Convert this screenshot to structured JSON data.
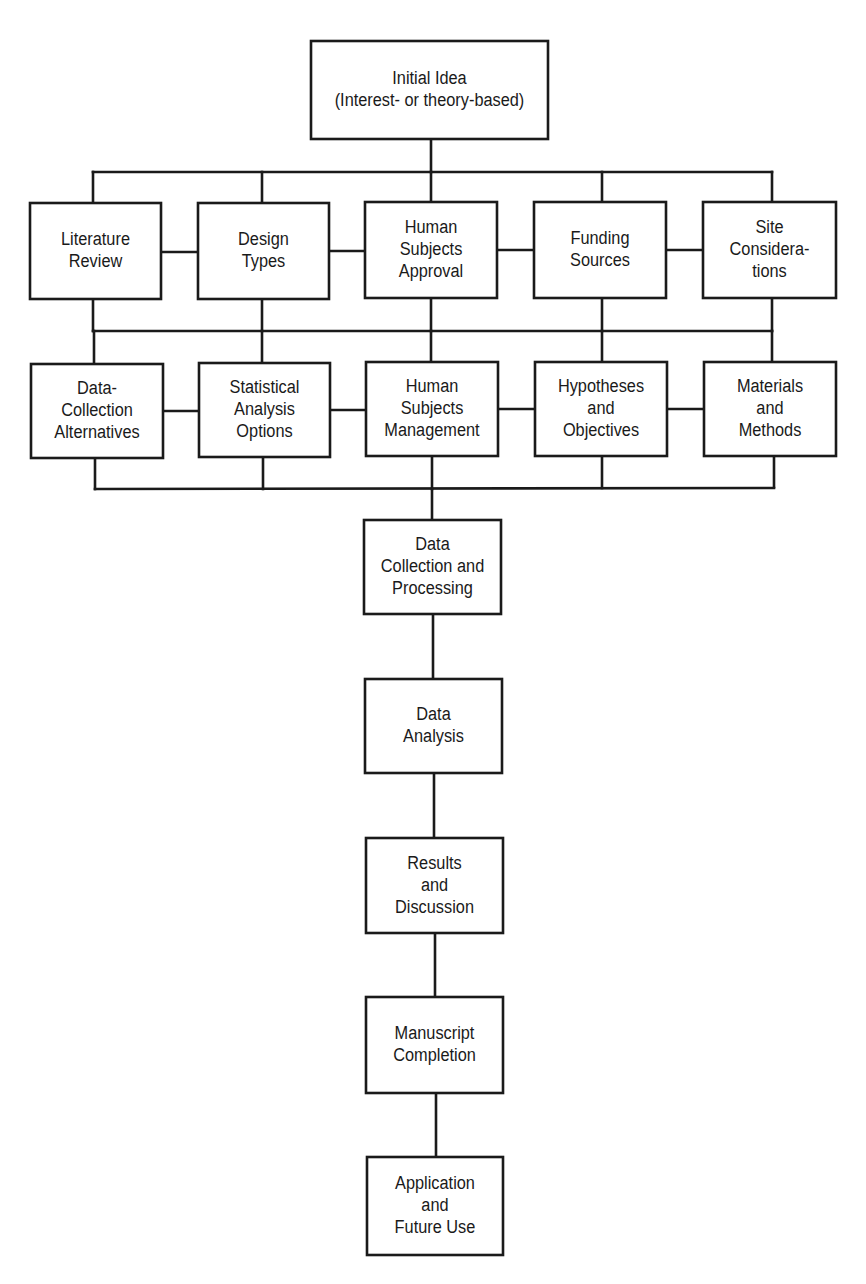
{
  "diagram": {
    "colors": {
      "line": "#1a1a1a",
      "fill": "#ffffff",
      "text": "#1a1a1a"
    },
    "nodes": [
      {
        "id": "initial-idea",
        "x": 311,
        "y": 41,
        "w": 237,
        "h": 98,
        "lines": [
          "Initial Idea",
          "(Interest- or theory-based)"
        ]
      },
      {
        "id": "literature-review",
        "x": 30,
        "y": 203,
        "w": 131,
        "h": 96,
        "lines": [
          "Literature",
          "Review"
        ]
      },
      {
        "id": "design-types",
        "x": 198,
        "y": 203,
        "w": 131,
        "h": 96,
        "lines": [
          "Design",
          "Types"
        ]
      },
      {
        "id": "human-subjects-approval",
        "x": 365,
        "y": 202,
        "w": 132,
        "h": 96,
        "lines": [
          "Human",
          "Subjects",
          "Approval"
        ]
      },
      {
        "id": "funding-sources",
        "x": 534,
        "y": 202,
        "w": 132,
        "h": 96,
        "lines": [
          "Funding",
          "Sources"
        ]
      },
      {
        "id": "site-considerations",
        "x": 703,
        "y": 202,
        "w": 133,
        "h": 96,
        "lines": [
          "Site",
          "Considera-",
          "tions"
        ]
      },
      {
        "id": "data-collection-alternatives",
        "x": 31,
        "y": 364,
        "w": 132,
        "h": 94,
        "lines": [
          "Data-",
          "Collection",
          "Alternatives"
        ]
      },
      {
        "id": "statistical-analysis-options",
        "x": 199,
        "y": 363,
        "w": 131,
        "h": 94,
        "lines": [
          "Statistical",
          "Analysis",
          "Options"
        ]
      },
      {
        "id": "human-subjects-management",
        "x": 366,
        "y": 362,
        "w": 132,
        "h": 94,
        "lines": [
          "Human",
          "Subjects",
          "Management"
        ]
      },
      {
        "id": "hypotheses-and-objectives",
        "x": 535,
        "y": 362,
        "w": 132,
        "h": 94,
        "lines": [
          "Hypotheses",
          "and",
          "Objectives"
        ]
      },
      {
        "id": "materials-and-methods",
        "x": 704,
        "y": 362,
        "w": 132,
        "h": 94,
        "lines": [
          "Materials",
          "and",
          "Methods"
        ]
      },
      {
        "id": "data-collection-and-processing",
        "x": 364,
        "y": 520,
        "w": 137,
        "h": 94,
        "lines": [
          "Data",
          "Collection and",
          "Processing"
        ]
      },
      {
        "id": "data-analysis",
        "x": 365,
        "y": 679,
        "w": 137,
        "h": 94,
        "lines": [
          "Data",
          "Analysis"
        ]
      },
      {
        "id": "results-and-discussion",
        "x": 366,
        "y": 838,
        "w": 137,
        "h": 95,
        "lines": [
          "Results",
          "and",
          "Discussion"
        ]
      },
      {
        "id": "manuscript-completion",
        "x": 366,
        "y": 997,
        "w": 137,
        "h": 96,
        "lines": [
          "Manuscript",
          "Completion"
        ]
      },
      {
        "id": "application-and-future-use",
        "x": 367,
        "y": 1157,
        "w": 136,
        "h": 98,
        "lines": [
          "Application",
          "and",
          "Future Use"
        ]
      }
    ],
    "edges": [
      {
        "id": "top-stem",
        "points": [
          [
            431,
            139
          ],
          [
            431,
            172
          ]
        ]
      },
      {
        "id": "bus-top",
        "points": [
          [
            93,
            172
          ],
          [
            772,
            172
          ]
        ]
      },
      {
        "id": "drop-1",
        "points": [
          [
            93,
            172
          ],
          [
            93,
            203
          ]
        ]
      },
      {
        "id": "drop-2",
        "points": [
          [
            262,
            172
          ],
          [
            262,
            203
          ]
        ]
      },
      {
        "id": "drop-3",
        "points": [
          [
            431,
            172
          ],
          [
            431,
            202
          ]
        ]
      },
      {
        "id": "drop-4",
        "points": [
          [
            602,
            172
          ],
          [
            602,
            202
          ]
        ]
      },
      {
        "id": "drop-5",
        "points": [
          [
            772,
            172
          ],
          [
            772,
            202
          ]
        ]
      },
      {
        "id": "row1-link-1",
        "points": [
          [
            161,
            252
          ],
          [
            198,
            252
          ]
        ]
      },
      {
        "id": "row1-link-2",
        "points": [
          [
            329,
            251
          ],
          [
            365,
            251
          ]
        ]
      },
      {
        "id": "row1-link-3",
        "points": [
          [
            497,
            250
          ],
          [
            534,
            250
          ]
        ]
      },
      {
        "id": "row1-link-4",
        "points": [
          [
            666,
            250
          ],
          [
            703,
            250
          ]
        ]
      },
      {
        "id": "row1-down-1",
        "points": [
          [
            93,
            299
          ],
          [
            93,
            331
          ]
        ]
      },
      {
        "id": "row1-down-2",
        "points": [
          [
            262,
            299
          ],
          [
            262,
            331
          ]
        ]
      },
      {
        "id": "row1-down-3",
        "points": [
          [
            431,
            298
          ],
          [
            431,
            331
          ]
        ]
      },
      {
        "id": "row1-down-4",
        "points": [
          [
            602,
            298
          ],
          [
            602,
            331
          ]
        ]
      },
      {
        "id": "row1-down-5",
        "points": [
          [
            772,
            298
          ],
          [
            772,
            331
          ]
        ]
      },
      {
        "id": "bus-middle",
        "points": [
          [
            93,
            331
          ],
          [
            772,
            331
          ]
        ]
      },
      {
        "id": "row2-up-1",
        "points": [
          [
            94,
            331
          ],
          [
            94,
            364
          ]
        ]
      },
      {
        "id": "row2-up-2",
        "points": [
          [
            262,
            331
          ],
          [
            262,
            363
          ]
        ]
      },
      {
        "id": "row2-up-3",
        "points": [
          [
            431,
            331
          ],
          [
            431,
            362
          ]
        ]
      },
      {
        "id": "row2-up-4",
        "points": [
          [
            602,
            331
          ],
          [
            602,
            362
          ]
        ]
      },
      {
        "id": "row2-up-5",
        "points": [
          [
            772,
            331
          ],
          [
            772,
            362
          ]
        ]
      },
      {
        "id": "row2-link-1",
        "points": [
          [
            163,
            411
          ],
          [
            199,
            411
          ]
        ]
      },
      {
        "id": "row2-link-2",
        "points": [
          [
            330,
            410
          ],
          [
            366,
            410
          ]
        ]
      },
      {
        "id": "row2-link-3",
        "points": [
          [
            498,
            409
          ],
          [
            535,
            409
          ]
        ]
      },
      {
        "id": "row2-link-4",
        "points": [
          [
            667,
            409
          ],
          [
            704,
            409
          ]
        ]
      },
      {
        "id": "row2-down-1",
        "points": [
          [
            95,
            458
          ],
          [
            95,
            489
          ]
        ]
      },
      {
        "id": "row2-down-2",
        "points": [
          [
            263,
            457
          ],
          [
            263,
            489
          ]
        ]
      },
      {
        "id": "row2-down-3",
        "points": [
          [
            432,
            456
          ],
          [
            432,
            489
          ]
        ]
      },
      {
        "id": "row2-down-4",
        "points": [
          [
            602,
            456
          ],
          [
            602,
            488
          ]
        ]
      },
      {
        "id": "row2-down-5",
        "points": [
          [
            774,
            456
          ],
          [
            774,
            487
          ]
        ]
      },
      {
        "id": "bus-bottom",
        "points": [
          [
            95,
            489
          ],
          [
            774,
            488
          ]
        ]
      },
      {
        "id": "chain-1",
        "points": [
          [
            432,
            489
          ],
          [
            432,
            520
          ]
        ]
      },
      {
        "id": "chain-2",
        "points": [
          [
            433,
            614
          ],
          [
            433,
            679
          ]
        ]
      },
      {
        "id": "chain-3",
        "points": [
          [
            434,
            773
          ],
          [
            434,
            838
          ]
        ]
      },
      {
        "id": "chain-4",
        "points": [
          [
            435,
            933
          ],
          [
            435,
            997
          ]
        ]
      },
      {
        "id": "chain-5",
        "points": [
          [
            436,
            1093
          ],
          [
            436,
            1157
          ]
        ]
      }
    ]
  }
}
